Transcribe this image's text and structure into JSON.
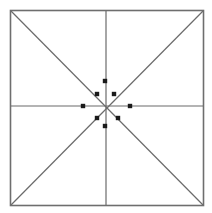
{
  "figure": {
    "canvas": {
      "width": 212,
      "height": 213,
      "background": "#ffffff"
    },
    "frame": {
      "name": "outer-square",
      "x": 10.5,
      "y": 10.5,
      "width": 193,
      "height": 195,
      "stroke_color": "#6e6e6e",
      "stroke_width": 1.6
    },
    "center": {
      "x": 106,
      "y": 106
    },
    "line_color": "#6b6b6b",
    "line_width": 1.2,
    "dot_color": "#1a1a1a",
    "dot_size": 4.4,
    "lines": [
      {
        "name": "vertical-midline",
        "x1": 106,
        "y1": 10.5,
        "x2": 106,
        "y2": 205.5
      },
      {
        "name": "horizontal-midline",
        "x1": 10.5,
        "y1": 106,
        "x2": 203.5,
        "y2": 106
      },
      {
        "name": "diagonal-tl-br",
        "x1": 10.5,
        "y1": 10.5,
        "x2": 203.5,
        "y2": 205.5
      },
      {
        "name": "diagonal-tr-bl",
        "x1": 203.5,
        "y1": 10.5,
        "x2": 10.5,
        "y2": 205.5
      }
    ],
    "nodes": [
      {
        "name": "node-north",
        "direction": "N",
        "x": 105,
        "y": 81,
        "dx": -1,
        "dy": -25
      },
      {
        "name": "node-northeast",
        "direction": "NE",
        "x": 114,
        "y": 94,
        "dx": 8,
        "dy": -12
      },
      {
        "name": "node-east",
        "direction": "E",
        "x": 130,
        "y": 106,
        "dx": 24,
        "dy": 0
      },
      {
        "name": "node-southeast",
        "direction": "SE",
        "x": 118,
        "y": 118,
        "dx": 12,
        "dy": 12
      },
      {
        "name": "node-south",
        "direction": "S",
        "x": 105,
        "y": 126,
        "dx": -1,
        "dy": 20
      },
      {
        "name": "node-southwest",
        "direction": "SW",
        "x": 97,
        "y": 118,
        "dx": -9,
        "dy": 12
      },
      {
        "name": "node-west",
        "direction": "W",
        "x": 83,
        "y": 106,
        "dx": -23,
        "dy": 0
      },
      {
        "name": "node-northwest",
        "direction": "NW",
        "x": 97,
        "y": 94,
        "dx": -9,
        "dy": -12
      }
    ]
  },
  "chart_data": {
    "type": "scatter",
    "xlabel": "",
    "ylabel": "",
    "xlim": [
      10.5,
      203.5
    ],
    "ylim": [
      10.5,
      205.5
    ],
    "grid": false,
    "legend": null,
    "annotations": [],
    "categories": [
      "N",
      "NE",
      "E",
      "SE",
      "S",
      "SW",
      "W",
      "NW"
    ],
    "x": [
      105,
      114,
      130,
      118,
      105,
      97,
      83,
      97
    ],
    "y": [
      81,
      94,
      106,
      118,
      126,
      118,
      106,
      94
    ],
    "radii_from_center": [
      25,
      14.4,
      24,
      17,
      20,
      15,
      23,
      15
    ],
    "angles_deg": [
      90,
      45,
      0,
      315,
      270,
      225,
      180,
      135
    ]
  }
}
